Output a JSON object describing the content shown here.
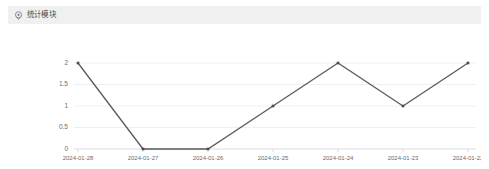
{
  "card": {
    "header": {
      "icon": "location-pin-icon",
      "title": "统计模块"
    }
  },
  "colors": {
    "header_bg": "#f0f0f0",
    "card_bg": "#ffffff",
    "series_line": "#5a5a5a",
    "marker": "#4a4a4a",
    "gridline": "#e9ecef",
    "axis": "#cfd3d6",
    "tick_text": "#6b6b6b"
  },
  "chart_data": {
    "type": "line",
    "title": "",
    "xlabel": "",
    "ylabel": "",
    "categories": [
      "2024-01-28",
      "2024-01-27",
      "2024-01-26",
      "2024-01-25",
      "2024-01-24",
      "2024-01-23",
      "2024-01-22"
    ],
    "values": [
      2,
      0,
      0,
      1,
      2,
      1,
      2
    ],
    "ylim": [
      0,
      2
    ],
    "yticks": [
      0,
      0.5,
      1,
      1.5,
      2
    ],
    "ytick_labels": [
      "0",
      "0.5",
      "1",
      "1.5",
      "2"
    ],
    "grid": true,
    "legend": false,
    "markers": "square"
  }
}
